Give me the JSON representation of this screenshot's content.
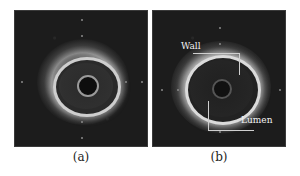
{
  "figure": {
    "panels": [
      {
        "id": "a",
        "caption": "(a)"
      },
      {
        "id": "b",
        "caption": "(b)",
        "annotations": {
          "wall": "Wall",
          "lumen": "Lumen"
        }
      }
    ]
  }
}
